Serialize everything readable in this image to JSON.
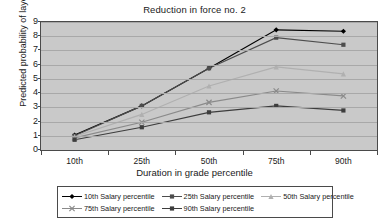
{
  "chart_data": {
    "type": "line",
    "title": "Reduction in force no. 2",
    "xlabel": "Duration in grade percentile",
    "ylabel": "Predicted probability of layoff",
    "categories": [
      "10th",
      "25th",
      "50th",
      "75th",
      "90th"
    ],
    "ylim": [
      0,
      9
    ],
    "yticks": [
      0,
      1,
      2,
      3,
      4,
      5,
      6,
      7,
      8,
      9
    ],
    "grid": true,
    "legend_position": "bottom",
    "series": [
      {
        "name": "10th Salary percentile",
        "values": [
          1.05,
          3.1,
          5.75,
          8.45,
          8.35
        ],
        "color": "#000000",
        "marker": "diamond"
      },
      {
        "name": "25th Salary percentile",
        "values": [
          1.0,
          3.1,
          5.75,
          7.9,
          7.4
        ],
        "color": "#4d4d4d",
        "marker": "square"
      },
      {
        "name": "50th Salary percentile",
        "values": [
          0.95,
          2.5,
          4.5,
          5.85,
          5.35
        ],
        "color": "#b0b0b0",
        "marker": "triangle"
      },
      {
        "name": "75th Salary percentile",
        "values": [
          0.85,
          1.95,
          3.35,
          4.15,
          3.8
        ],
        "color": "#8a8a8a",
        "marker": "cross"
      },
      {
        "name": "90th Salary percentile",
        "values": [
          0.72,
          1.6,
          2.65,
          3.1,
          2.78
        ],
        "color": "#3d3d3d",
        "marker": "square"
      }
    ]
  },
  "legend": {
    "entries": [
      "10th Salary percentile",
      "25th Salary percentile",
      "50th Salary percentile",
      "75th Salary percentile",
      "90th Salary percentile"
    ]
  },
  "colors": {
    "plot_background": "#c9c9c9",
    "gridline": "#a8a8a8",
    "axis": "#4a4a4a",
    "page_background": "#ffffff"
  }
}
